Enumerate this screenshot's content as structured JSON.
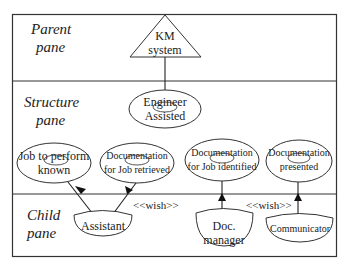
{
  "panes": {
    "parent": {
      "line1": "Parent",
      "line2": "pane"
    },
    "structure": {
      "line1": "Structure",
      "line2": "pane"
    },
    "child": {
      "line1": "Child",
      "line2": "pane"
    }
  },
  "nodes": {
    "km_system": {
      "line1": "KM",
      "line2": "system",
      "shape": "triangle"
    },
    "engineer_assisted": {
      "line1": "Engineer",
      "line2": "Assisted",
      "shape": "ellipse"
    },
    "job_to_perform_known": {
      "line1": "Job to perform",
      "line2": "known",
      "shape": "ellipse"
    },
    "doc_for_job_retrieved": {
      "line1": "Documentation",
      "line2": "for Job retrieved",
      "shape": "ellipse"
    },
    "doc_for_job_identified": {
      "line1": "Documentation",
      "line2": "for Job identified",
      "shape": "ellipse"
    },
    "doc_presented": {
      "line1": "Documentation",
      "line2": "presented",
      "shape": "ellipse"
    },
    "assistant": {
      "line1": "Assistant",
      "shape": "bowl"
    },
    "doc_manager": {
      "line1": "Doc.",
      "line2": "manager",
      "shape": "bowl"
    },
    "communicator": {
      "line1": "Communicator",
      "shape": "bowl"
    }
  },
  "stereotypes": {
    "wish_1": "<<wish>>",
    "wish_2": "<<wish>>"
  },
  "colors": {
    "line": "#333333",
    "background": "#ffffff",
    "text": "#222222"
  }
}
